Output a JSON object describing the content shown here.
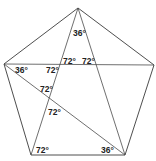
{
  "diagram": {
    "vertices": {
      "A": [
        78,
        8
      ],
      "B": [
        154,
        65
      ],
      "C": [
        125,
        155
      ],
      "D": [
        31,
        155
      ],
      "E": [
        4,
        64
      ]
    },
    "labels": [
      {
        "text": "36°",
        "x": 73,
        "y": 36
      },
      {
        "text": "72°",
        "x": 64,
        "y": 64
      },
      {
        "text": "72°",
        "x": 82,
        "y": 64
      },
      {
        "text": "36°",
        "x": 15,
        "y": 73
      },
      {
        "text": "72°",
        "x": 46,
        "y": 73
      },
      {
        "text": "72°",
        "x": 40,
        "y": 92
      },
      {
        "text": "72°",
        "x": 48,
        "y": 115
      },
      {
        "text": "72°",
        "x": 36,
        "y": 154
      },
      {
        "text": "36°",
        "x": 101,
        "y": 154
      }
    ]
  }
}
